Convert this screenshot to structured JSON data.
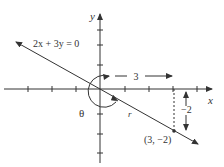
{
  "diagram": {
    "equation_label": "2x + 3y = 0",
    "x_axis_label": "x",
    "y_axis_label": "y",
    "angle_label": "θ",
    "radius_label": "r",
    "point_label": "(3, −2)",
    "horizontal_dim_label": "3",
    "vertical_dim_label": "−2",
    "colors": {
      "stroke": "#333333",
      "background": "#ffffff"
    }
  }
}
